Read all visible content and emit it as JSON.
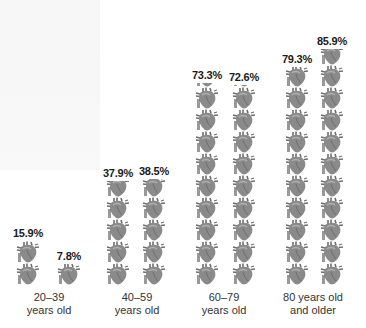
{
  "chart_data": {
    "type": "bar",
    "style": "pictogram",
    "icon": "anatomical-heart-icon",
    "icon_unit_percent": 8,
    "categories": [
      "20–39 years old",
      "40–59 years old",
      "60–79 years old",
      "80 years old and older"
    ],
    "series": [
      {
        "name": "Group A",
        "values": [
          15.9,
          37.9,
          73.3,
          79.3
        ]
      },
      {
        "name": "Group B",
        "values": [
          7.8,
          38.5,
          72.6,
          85.9
        ]
      }
    ],
    "title": "",
    "xlabel": "",
    "ylabel": "",
    "ylim": [
      0,
      100
    ],
    "grid": false,
    "legend": "none"
  },
  "colors": {
    "heart_fill": "#8a8a8a",
    "heart_dark": "#6e6e6e",
    "heart_light": "#b0b0b0",
    "text": "#1a1a1a",
    "label": "#333333"
  },
  "columns": [
    {
      "pct_label": "15.9%",
      "value": 15.9,
      "x": 14
    },
    {
      "pct_label": "7.8%",
      "value": 7.8,
      "x": 55
    },
    {
      "pct_label": "37.9%",
      "value": 37.9,
      "x": 104
    },
    {
      "pct_label": "38.5%",
      "value": 38.5,
      "x": 140
    },
    {
      "pct_label": "73.3%",
      "value": 73.3,
      "x": 193
    },
    {
      "pct_label": "72.6%",
      "value": 72.6,
      "x": 230
    },
    {
      "pct_label": "79.3%",
      "value": 79.3,
      "x": 283
    },
    {
      "pct_label": "85.9%",
      "value": 85.9,
      "x": 318
    }
  ],
  "groups": [
    {
      "line1": "20–39",
      "line2": "years old",
      "x": 9
    },
    {
      "line1": "40–59",
      "line2": "years old",
      "x": 97
    },
    {
      "line1": "60–79",
      "line2": "years old",
      "x": 184
    },
    {
      "line1": "80 years old",
      "line2": "and older",
      "x": 273
    }
  ]
}
